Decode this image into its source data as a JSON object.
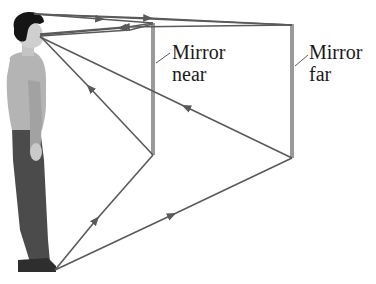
{
  "figure": {
    "labels": {
      "mirror_near": {
        "line1": "Mirror",
        "line2": "near"
      },
      "mirror_far": {
        "line1": "Mirror",
        "line2": "far"
      }
    },
    "colors": {
      "ray": "#5a5a5a",
      "mirror": "#9a9a9a",
      "text": "#1a1a1a",
      "background": "#ffffff"
    },
    "elements": [
      "person-standing",
      "mirror-near",
      "mirror-far",
      "light-rays-from-head",
      "light-rays-from-feet"
    ]
  }
}
